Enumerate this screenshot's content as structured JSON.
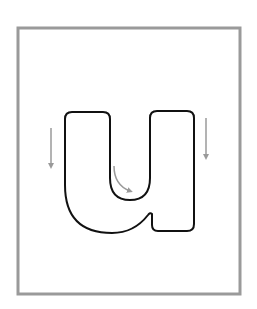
{
  "worksheet": {
    "letter": "u",
    "title": "Letter u tracing card",
    "frame": {
      "x": 18,
      "y": 28,
      "width": 222,
      "height": 266,
      "stroke_color": "#9a9a9a",
      "stroke_width": 3
    },
    "glyph": {
      "stroke_color": "#111111",
      "fill_color": "#ffffff",
      "stroke_width": 2
    },
    "arrows": {
      "color": "#9a9a9a",
      "items": [
        {
          "name": "left-stroke-arrow",
          "direction": "down",
          "x": 51,
          "y1": 128,
          "y2": 171
        },
        {
          "name": "curve-stroke-arrow",
          "direction": "down-right-curve",
          "start_x": 114,
          "start_y": 166,
          "end_x": 134,
          "end_y": 193
        },
        {
          "name": "right-stroke-arrow",
          "direction": "down",
          "x": 206,
          "y1": 118,
          "y2": 162
        }
      ]
    }
  }
}
